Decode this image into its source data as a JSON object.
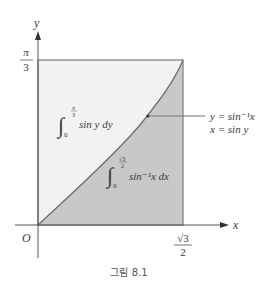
{
  "figure": {
    "caption": "그림 8.1",
    "axes": {
      "x_label": "x",
      "y_label": "y",
      "origin_label": "O",
      "x_tick": {
        "num": "√3",
        "den": "2"
      },
      "y_tick": {
        "num": "π",
        "den": "3"
      }
    },
    "regions": {
      "upper": {
        "integral_lower": "0",
        "integral_upper_num": "π",
        "integral_upper_den": "3",
        "integrand": "sin y dy",
        "color": "#f2f2f2"
      },
      "lower": {
        "integral_lower": "0",
        "integral_upper_num": "√3",
        "integral_upper_den": "2",
        "integrand": "sin⁻¹x dx",
        "color": "#c8c8c8"
      }
    },
    "curve_label": {
      "line1": "y = sin⁻¹x",
      "line2": "x = sin y"
    },
    "colors": {
      "axis": "#555555",
      "rect_border": "#8c8c8c",
      "curve": "#6e6e6e",
      "upper_fill": "#f2f2f2",
      "lower_fill": "#c8c8c8"
    }
  }
}
